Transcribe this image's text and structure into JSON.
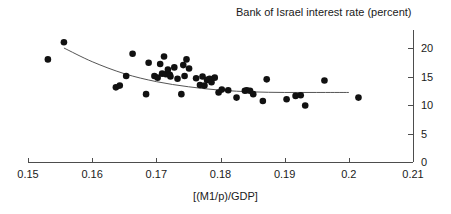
{
  "chart_data": {
    "type": "scatter",
    "title": "Bank of Israel interest rate (percent)",
    "xlabel": "[(M1/p)/GDP]",
    "ylabel": "",
    "xlim": [
      0.15,
      0.21
    ],
    "ylim": [
      0,
      22.5
    ],
    "xticks": [
      0.15,
      0.16,
      0.17,
      0.18,
      0.19,
      0.2,
      0.21
    ],
    "xtick_labels": [
      "0.15",
      "0.16",
      "0.17",
      "0.18",
      "0.19",
      "0.2",
      "0.21"
    ],
    "yticks": [
      0,
      5,
      10,
      15,
      20
    ],
    "ytick_labels": [
      "0",
      "5",
      "10",
      "15",
      "20"
    ],
    "y_axis_position": "right",
    "grid": false,
    "legend": null,
    "marker_color": "#111111",
    "marker_size": 4.6,
    "line_color": "#555555",
    "series": [
      {
        "name": "Bank of Israel interest rate",
        "type": "scatter",
        "points": [
          [
            0.1531,
            18.0
          ],
          [
            0.1556,
            21.0
          ],
          [
            0.1637,
            13.1
          ],
          [
            0.1643,
            13.4
          ],
          [
            0.1653,
            15.1
          ],
          [
            0.1663,
            19.0
          ],
          [
            0.1684,
            11.9
          ],
          [
            0.1688,
            17.4
          ],
          [
            0.1697,
            15.1
          ],
          [
            0.1702,
            14.8
          ],
          [
            0.1706,
            17.2
          ],
          [
            0.1709,
            15.5
          ],
          [
            0.1712,
            18.5
          ],
          [
            0.1715,
            15.4
          ],
          [
            0.1718,
            16.2
          ],
          [
            0.1721,
            15.3
          ],
          [
            0.1722,
            15.0
          ],
          [
            0.1728,
            16.6
          ],
          [
            0.1733,
            14.6
          ],
          [
            0.1739,
            11.9
          ],
          [
            0.1742,
            17.0
          ],
          [
            0.1744,
            15.1
          ],
          [
            0.1747,
            18.0
          ],
          [
            0.1751,
            16.4
          ],
          [
            0.1762,
            14.7
          ],
          [
            0.1768,
            13.5
          ],
          [
            0.1772,
            15.0
          ],
          [
            0.1775,
            13.4
          ],
          [
            0.1779,
            14.4
          ],
          [
            0.1783,
            14.6
          ],
          [
            0.1786,
            14.0
          ],
          [
            0.1791,
            14.8
          ],
          [
            0.1797,
            12.2
          ],
          [
            0.1802,
            12.7
          ],
          [
            0.1812,
            12.6
          ],
          [
            0.1825,
            11.3
          ],
          [
            0.1838,
            12.5
          ],
          [
            0.1841,
            12.6
          ],
          [
            0.1846,
            12.5
          ],
          [
            0.1851,
            11.9
          ],
          [
            0.1866,
            10.7
          ],
          [
            0.1872,
            14.5
          ],
          [
            0.1903,
            11.0
          ],
          [
            0.1917,
            11.6
          ],
          [
            0.1925,
            11.7
          ],
          [
            0.1932,
            9.9
          ],
          [
            0.1962,
            14.3
          ],
          [
            0.2015,
            11.3
          ]
        ]
      },
      {
        "name": "fitted curve",
        "type": "line",
        "points": [
          [
            0.1556,
            20.0
          ],
          [
            0.16,
            17.6
          ],
          [
            0.165,
            15.5
          ],
          [
            0.17,
            14.1
          ],
          [
            0.175,
            13.2
          ],
          [
            0.18,
            12.6
          ],
          [
            0.185,
            12.3
          ],
          [
            0.19,
            12.2
          ],
          [
            0.195,
            12.2
          ],
          [
            0.2,
            12.2
          ]
        ]
      }
    ]
  },
  "figure": {
    "title": "Bank of Israel interest rate (percent)",
    "x_axis_title": "[(M1/p)/GDP]"
  }
}
